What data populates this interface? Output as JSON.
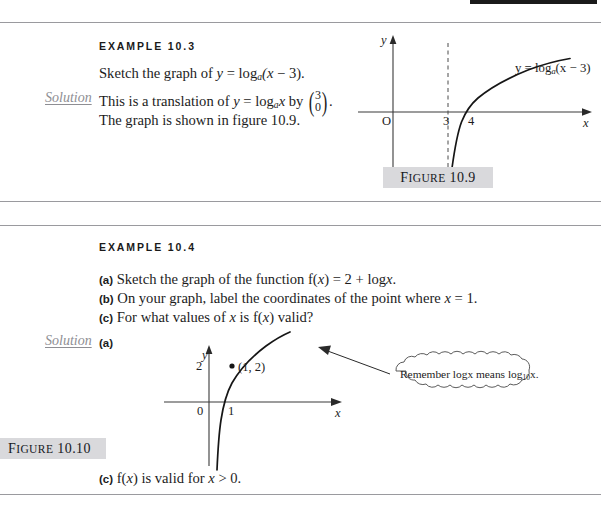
{
  "page": {
    "accent_black": "#1a1a1a",
    "rule_color": "#9a9a9e",
    "chip_bg": "#d9d9dc"
  },
  "example_1": {
    "heading": "EXAMPLE 10.3",
    "question_prefix": "Sketch the graph of ",
    "question_y": "y",
    "question_eq": " = log",
    "question_base": "a",
    "question_tail": "(x − 3).",
    "solution_label": "Solution",
    "solution_line1_a": "This is a translation of ",
    "solution_line1_y": "y",
    "solution_line1_b": " = log",
    "solution_line1_base": "a",
    "solution_line1_x": "x",
    "solution_line1_c": " by ",
    "vector_top": "3",
    "vector_bottom": "0",
    "solution_line1_d": ".",
    "solution_line2": "The graph is shown in figure 10.9.",
    "figure_caption_word": "Figure",
    "figure_caption_number": "10.9"
  },
  "figure_1": {
    "y_axis_label": "y",
    "x_axis_label": "x",
    "origin_label": "O",
    "tick_3": "3",
    "tick_4": "4",
    "curve_label_y": "y",
    "curve_label_eq": " = log",
    "curve_label_base": "a",
    "curve_label_tail": "(x − 3)",
    "asymptote_style": "dashed",
    "asymptote_at_x": "3"
  },
  "example_2": {
    "heading": "EXAMPLE 10.4",
    "part_a_tag": "(a)",
    "part_a_text_1": " Sketch the graph of the function f(",
    "part_a_x": "x",
    "part_a_text_2": ") = 2 + log",
    "part_a_x2": "x",
    "part_a_text_3": ".",
    "part_b_tag": "(b)",
    "part_b_text_1": " On your graph, label the coordinates of the point where ",
    "part_b_x": "x",
    "part_b_text_2": " = 1.",
    "part_c_tag": "(c)",
    "part_c_text_1": " For what values of ",
    "part_c_x": "x",
    "part_c_text_2": " is f(",
    "part_c_x2": "x",
    "part_c_text_3": ") valid?",
    "solution_label": "Solution",
    "solution_part_tag": "(a)",
    "answer_c_tag": "(c)",
    "answer_c_text_1": " f(",
    "answer_c_x": "x",
    "answer_c_text_2": ") is valid for ",
    "answer_c_x2": "x",
    "answer_c_text_3": " > 0.",
    "figure_caption_word": "Figure",
    "figure_caption_number": "10.10"
  },
  "figure_2": {
    "y_axis_label": "y",
    "x_axis_label": "x",
    "origin_label": "0",
    "tick_2": "2",
    "tick_1": "1",
    "point_label": "(1, 2)",
    "callout_text_1": "Remember log",
    "callout_x1": "x",
    "callout_text_2": " means log",
    "callout_sub": "10",
    "callout_x2": "x",
    "callout_text_3": "."
  }
}
